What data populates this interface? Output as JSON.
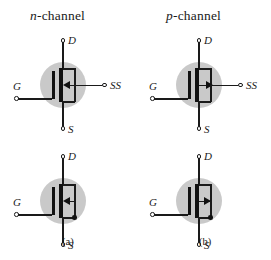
{
  "figure": {
    "title_row": {
      "n_channel": {
        "prefix": "n",
        "rest": "-channel"
      },
      "p_channel": {
        "prefix": "p",
        "rest": "-channel"
      }
    },
    "captions": {
      "a": "(a)",
      "b": "(b)"
    },
    "colors": {
      "bulk_fill": "#c9c9c9",
      "ink": "#1a1a1a",
      "background": "#ffffff"
    },
    "terminal_labels": {
      "drain": "D",
      "gate": "G",
      "source": "S",
      "substrate": "SS"
    },
    "symbols": [
      {
        "id": "n-channel-4-terminal",
        "channel_type": "n",
        "terminals": [
          "D",
          "G",
          "S",
          "SS"
        ],
        "body_arrow_direction": "left",
        "body_tied_to_source": false,
        "column": "a",
        "row": "top"
      },
      {
        "id": "p-channel-4-terminal",
        "channel_type": "p",
        "terminals": [
          "D",
          "G",
          "S",
          "SS"
        ],
        "body_arrow_direction": "right",
        "body_tied_to_source": false,
        "column": "b",
        "row": "top"
      },
      {
        "id": "n-channel-3-terminal",
        "channel_type": "n",
        "terminals": [
          "D",
          "G",
          "S"
        ],
        "body_arrow_direction": "left",
        "body_tied_to_source": true,
        "column": "a",
        "row": "bottom"
      },
      {
        "id": "p-channel-3-terminal",
        "channel_type": "p",
        "terminals": [
          "D",
          "G",
          "S"
        ],
        "body_arrow_direction": "right",
        "body_tied_to_source": true,
        "column": "b",
        "row": "bottom"
      }
    ]
  }
}
